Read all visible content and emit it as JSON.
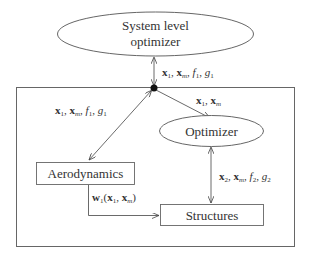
{
  "diagram": {
    "nodes": {
      "system_optimizer": {
        "line1": "System level",
        "line2": "optimizer"
      },
      "optimizer": {
        "label": "Optimizer"
      },
      "aerodynamics": {
        "label": "Aerodynamics"
      },
      "structures": {
        "label": "Structures"
      }
    },
    "edges": {
      "system_to_hub": {
        "x1": "x",
        "s1": "1",
        "sep1": ", ",
        "xm": "x",
        "sm": "m",
        "sep2": ", ",
        "f": "f",
        "fs": "1",
        "sep3": ", ",
        "g": "g",
        "gs": "1"
      },
      "hub_to_aero": {
        "x1": "x",
        "s1": "1",
        "sep1": ", ",
        "xm": "x",
        "sm": "m",
        "sep2": ", ",
        "f": "f",
        "fs": "1",
        "sep3": ", ",
        "g": "g",
        "gs": "1"
      },
      "hub_to_optimizer": {
        "x1": "x",
        "s1": "1",
        "sep1": ", ",
        "xm": "x",
        "sm": "m"
      },
      "optimizer_to_structures": {
        "x2": "x",
        "s2": "2",
        "sep1": ", ",
        "xm": "x",
        "sm": "m",
        "sep2": ", ",
        "f": "f",
        "fs": "2",
        "sep3": ", ",
        "g": "g",
        "gs": "2"
      },
      "aero_to_structures": {
        "w": "w",
        "ws": "1",
        "open": "(",
        "x1": "x",
        "s1": "1",
        "sep1": ", ",
        "xm": "x",
        "sm": "m",
        "close": ")"
      }
    }
  }
}
